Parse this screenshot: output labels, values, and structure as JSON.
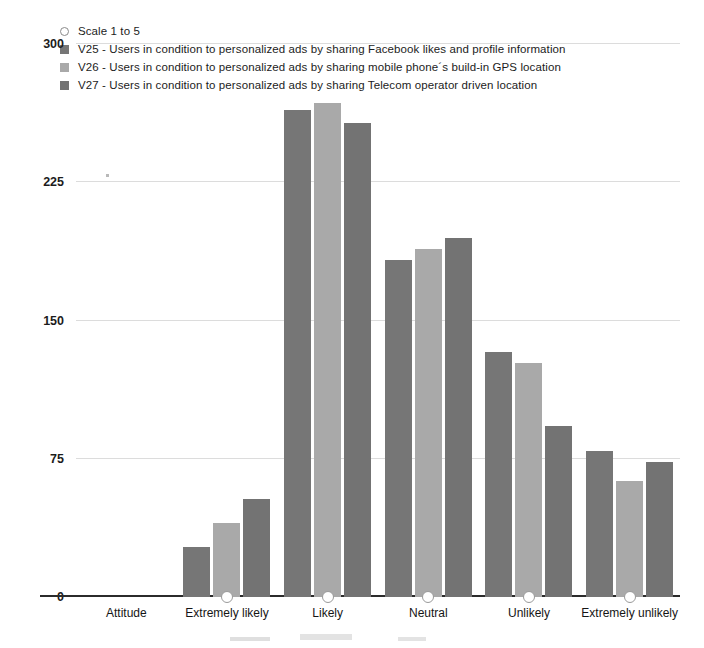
{
  "legend": {
    "marker_label": "Scale 1 to 5",
    "marker_icon": "open-circle-marker-icon",
    "entries": [
      {
        "key": "V25",
        "label": "V25 - Users in condition to personalized ads by sharing Facebook likes and profile information",
        "color": "#767676"
      },
      {
        "key": "V26",
        "label": "V26 - Users in condition to personalized ads by sharing mobile phone´s build-in GPS location",
        "color": "#a9a9a9"
      },
      {
        "key": "V27",
        "label": "V27 - Users in condition to personalized ads by sharing Telecom operator driven location",
        "color": "#737373"
      }
    ]
  },
  "chart_data": {
    "type": "bar",
    "title": "",
    "xlabel": "",
    "ylabel": "",
    "ylim": [
      0,
      300
    ],
    "yticks": [
      0,
      75,
      150,
      225,
      300
    ],
    "grid": true,
    "legend_position": "top",
    "categories": [
      "Attitude",
      "Extremely likely",
      "Likely",
      "Neutral",
      "Unlikely",
      "Extremely unlikely"
    ],
    "series": [
      {
        "name": "V25 - Users in condition to personalized ads by sharing Facebook likes and profile information",
        "color": "#767676",
        "values": [
          0,
          27,
          264,
          183,
          133,
          79
        ]
      },
      {
        "name": "V26 - Users in condition to personalized ads by sharing mobile phone´s build-in GPS location",
        "color": "#a9a9a9",
        "values": [
          0,
          40,
          268,
          189,
          127,
          63
        ]
      },
      {
        "name": "V27 - Users in condition to personalized ads by sharing Telecom operator driven location",
        "color": "#737373",
        "values": [
          0,
          53,
          257,
          195,
          93,
          73
        ]
      }
    ],
    "annotations": [
      {
        "name": "scale-marker",
        "label": "Scale 1 to 5",
        "categories": [
          "Extremely likely",
          "Likely",
          "Neutral",
          "Unlikely",
          "Extremely unlikely"
        ],
        "value": 0
      }
    ]
  }
}
